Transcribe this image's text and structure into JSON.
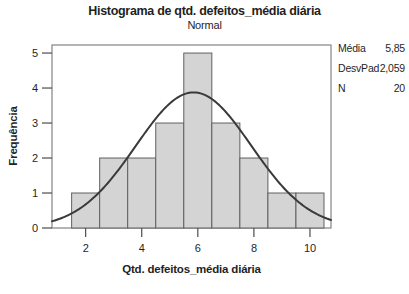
{
  "title": "Histograma de qtd. defeitos_média diária",
  "subtitle": "Normal",
  "stats": {
    "rows": [
      {
        "label": "Média",
        "value": "5,85"
      },
      {
        "label": "DesvPad",
        "value": "2,059"
      },
      {
        "label": "N",
        "value": "20"
      }
    ]
  },
  "chart_data": {
    "type": "bar",
    "subtype": "histogram-with-normal-fit",
    "title": "Histograma de qtd. defeitos_média diária",
    "subtitle": "Normal",
    "xlabel": "Qtd. defeitos_média diária",
    "ylabel": "Frequência",
    "categories": [
      2,
      3,
      4,
      5,
      6,
      7,
      8,
      9,
      10
    ],
    "values": [
      1,
      2,
      2,
      3,
      5,
      3,
      2,
      1,
      1
    ],
    "bin_width": 1,
    "x_ticks": [
      2,
      4,
      6,
      8,
      10
    ],
    "y_ticks": [
      0,
      1,
      2,
      3,
      4,
      5
    ],
    "xlim": [
      0.8,
      10.75
    ],
    "ylim": [
      0,
      5.23
    ],
    "grid": false,
    "overlay_curve": {
      "type": "normal",
      "mean": 5.85,
      "sd": 2.059,
      "n": 20
    },
    "colors": {
      "background": "#ffffff",
      "bar_fill": "#d4d4d4",
      "bar_stroke": "#606060",
      "curve": "#3a3a3a",
      "frame": "#848484",
      "tick": "#4d4d4d",
      "text": "#1f1f1f"
    }
  }
}
